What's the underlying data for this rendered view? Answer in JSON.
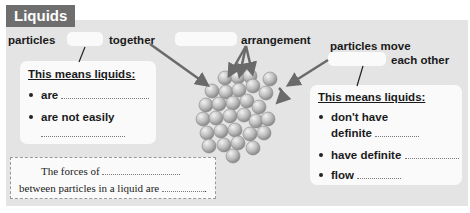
{
  "title": "Liquids",
  "labels": {
    "particles_together_pre": "particles",
    "particles_together_post": "together",
    "arrangement": "arrangement",
    "particles_move": "particles move",
    "each_other": "each other"
  },
  "left_card": {
    "heading": "This means liquids:",
    "bullets": [
      {
        "text": "are"
      },
      {
        "text": "are not easily"
      }
    ]
  },
  "right_card": {
    "heading": "This means liquids:",
    "bullets": [
      {
        "text": "don't have",
        "text2": "definite"
      },
      {
        "text": "have definite"
      },
      {
        "text": "flow"
      }
    ]
  },
  "forces_box": {
    "line1": "The forces of",
    "line2": "between particles in a liquid are",
    "end": "."
  },
  "colors": {
    "panel": "#e4e4e4",
    "title_bg": "#6e6e6e",
    "card": "#fafafa",
    "particle": "#bdbdbd",
    "arrow": "#777777"
  }
}
